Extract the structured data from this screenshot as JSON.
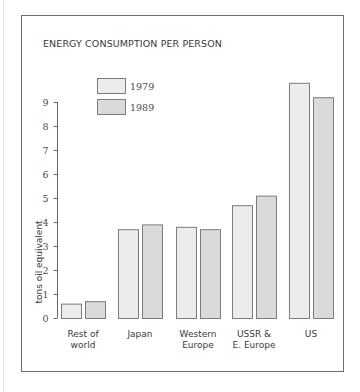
{
  "chart_data": {
    "type": "bar",
    "title": "ENERGY CONSUMPTION PER PERSON",
    "xlabel": "",
    "ylabel": "tons oil equivalent",
    "ylim": [
      0,
      9
    ],
    "yticks": [
      0,
      1,
      2,
      3,
      4,
      5,
      6,
      7,
      8,
      9
    ],
    "grid": false,
    "legend_position": "top-left",
    "categories": [
      [
        "Rest of",
        "world"
      ],
      [
        "Japan"
      ],
      [
        "Western",
        "Europe"
      ],
      [
        "USSR &",
        "E. Europe"
      ],
      [
        "US"
      ]
    ],
    "series": [
      {
        "name": "1979",
        "color": "#ececec",
        "values": [
          0.6,
          3.7,
          3.8,
          4.7,
          9.8
        ]
      },
      {
        "name": "1989",
        "color": "#dadada",
        "values": [
          0.7,
          3.9,
          3.7,
          5.1,
          9.2
        ]
      }
    ]
  }
}
